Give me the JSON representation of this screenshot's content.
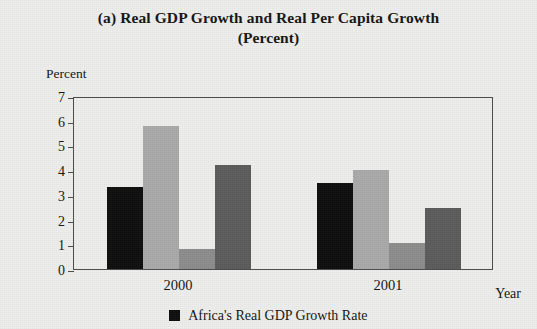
{
  "figure": {
    "title_line1": "(a) Real GDP Growth and Real Per Capita Growth",
    "title_line2": "(Percent)",
    "y_unit_label": "Percent",
    "x_axis_name": "Year"
  },
  "chart_data": {
    "type": "bar",
    "title": "(a) Real GDP Growth and Real Per Capita Growth (Percent)",
    "xlabel": "Year",
    "ylabel": "Percent",
    "ylim": [
      0,
      7
    ],
    "yticks": [
      "0",
      "1",
      "2",
      "3",
      "4",
      "5",
      "6",
      "7"
    ],
    "grid": false,
    "legend_position": "bottom",
    "categories": [
      "2000",
      "2001"
    ],
    "series": [
      {
        "name": "Africa's Real GDP Growth Rate",
        "color": "#0d0d0d",
        "values": [
          3.3,
          3.5
        ]
      },
      {
        "name": "series-2",
        "color": "#a9a9a9",
        "values": [
          5.8,
          4.0
        ]
      },
      {
        "name": "series-3",
        "color": "#8c8c8c",
        "values": [
          0.8,
          1.05
        ]
      },
      {
        "name": "series-4",
        "color": "#5b5b5b",
        "values": [
          4.2,
          2.45
        ]
      }
    ]
  },
  "legend": {
    "items": [
      {
        "label": "Africa's Real GDP Growth Rate",
        "color": "#0d0d0d"
      }
    ]
  }
}
